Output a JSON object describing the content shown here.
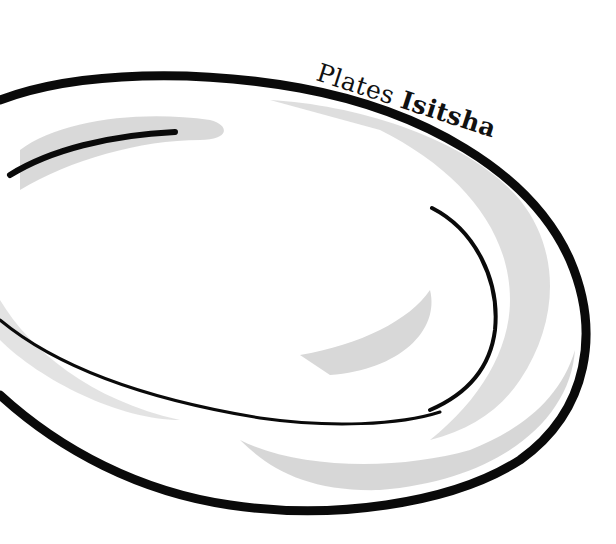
{
  "illustration": {
    "subject": "plate-drawing",
    "caption": {
      "english": "Plates",
      "zulu": "Isitsha"
    },
    "colors": {
      "background": "#ffffff",
      "ink": "#0a0a0a",
      "shade": "#cfcfcf"
    }
  }
}
